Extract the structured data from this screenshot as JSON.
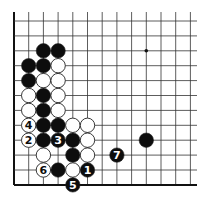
{
  "diagram": {
    "type": "go-board",
    "grid": {
      "x0": 14,
      "dx": 14.7,
      "cols": 13,
      "y0": 21,
      "dy": 14.9,
      "rows": 12,
      "left_edge": true,
      "bottom_edge": true,
      "top_edge": false,
      "right_edge": false,
      "line_extend_right": 197,
      "line_extend_top": 12
    },
    "star_points": [
      {
        "c": 9,
        "r": 2
      }
    ],
    "stones": [
      {
        "c": 2,
        "r": 2,
        "color": "black"
      },
      {
        "c": 3,
        "r": 2,
        "color": "black"
      },
      {
        "c": 1,
        "r": 3,
        "color": "black"
      },
      {
        "c": 2,
        "r": 3,
        "color": "black"
      },
      {
        "c": 3,
        "r": 3,
        "color": "white"
      },
      {
        "c": 1,
        "r": 4,
        "color": "black"
      },
      {
        "c": 2,
        "r": 4,
        "color": "white"
      },
      {
        "c": 3,
        "r": 4,
        "color": "white"
      },
      {
        "c": 1,
        "r": 5,
        "color": "white"
      },
      {
        "c": 2,
        "r": 5,
        "color": "black"
      },
      {
        "c": 3,
        "r": 5,
        "color": "white"
      },
      {
        "c": 1,
        "r": 6,
        "color": "white"
      },
      {
        "c": 2,
        "r": 6,
        "color": "black"
      },
      {
        "c": 3,
        "r": 6,
        "color": "white"
      },
      {
        "c": 1,
        "r": 7,
        "color": "white",
        "label": "4"
      },
      {
        "c": 2,
        "r": 7,
        "color": "black"
      },
      {
        "c": 3,
        "r": 7,
        "color": "black"
      },
      {
        "c": 4,
        "r": 7,
        "color": "white"
      },
      {
        "c": 5,
        "r": 7,
        "color": "white"
      },
      {
        "c": 1,
        "r": 8,
        "color": "white",
        "label": "2"
      },
      {
        "c": 2,
        "r": 8,
        "color": "black"
      },
      {
        "c": 3,
        "r": 8,
        "color": "black",
        "label": "3"
      },
      {
        "c": 4,
        "r": 8,
        "color": "black"
      },
      {
        "c": 5,
        "r": 8,
        "color": "white"
      },
      {
        "c": 9,
        "r": 8,
        "color": "black"
      },
      {
        "c": 2,
        "r": 9,
        "color": "white"
      },
      {
        "c": 4,
        "r": 9,
        "color": "black"
      },
      {
        "c": 5,
        "r": 9,
        "color": "white"
      },
      {
        "c": 7,
        "r": 9,
        "color": "black",
        "label": "7"
      },
      {
        "c": 2,
        "r": 10,
        "color": "white",
        "label": "6"
      },
      {
        "c": 3,
        "r": 10,
        "color": "black"
      },
      {
        "c": 4,
        "r": 10,
        "color": "white"
      },
      {
        "c": 5,
        "r": 10,
        "color": "black",
        "label": "1"
      },
      {
        "c": 4,
        "r": 11,
        "color": "black",
        "label": "5"
      }
    ],
    "colors": {
      "line": "#333333",
      "edge": "#111111",
      "black": "#0d0d0d",
      "white": "#ffffff",
      "stone_outline": "#222222"
    }
  }
}
